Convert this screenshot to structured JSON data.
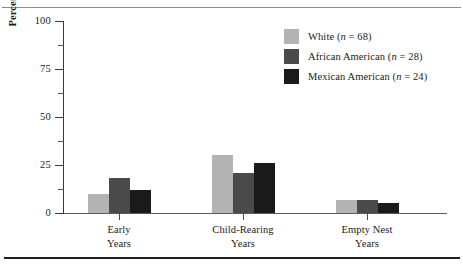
{
  "chart_data": {
    "type": "bar",
    "title": "",
    "xlabel": "",
    "ylabel": "Percentage Reporting Major Conflicts",
    "ylim": [
      0,
      100
    ],
    "yticks": [
      0,
      25,
      50,
      75,
      100
    ],
    "ytick_labels": [
      "0",
      "25",
      "50",
      "75",
      "100"
    ],
    "yminor_ticks": [
      12.5,
      37.5,
      62.5,
      87.5
    ],
    "grid": false,
    "legend_position": "top-right",
    "categories": [
      "Early Years",
      "Child-Rearing Years",
      "Empty Nest Years"
    ],
    "category_lines": [
      [
        "Early",
        "Years"
      ],
      [
        "Child-Rearing",
        "Years"
      ],
      [
        "Empty Nest",
        "Years"
      ]
    ],
    "series": [
      {
        "name": "White (n = 68)",
        "label_text": "White",
        "n": 68,
        "color": "#b3b3b3",
        "values": [
          10,
          30,
          7
        ]
      },
      {
        "name": "African American (n = 28)",
        "label_text": "African American",
        "n": 28,
        "color": "#4a4a4a",
        "values": [
          18,
          21,
          7
        ]
      },
      {
        "name": "Mexican American (n = 24)",
        "label_text": "Mexican American",
        "n": 24,
        "color": "#1a1a1a",
        "values": [
          12,
          26,
          5
        ]
      }
    ]
  },
  "legend": {
    "items": [
      {
        "label": "White (n = 68)",
        "name": "White",
        "n_prefix": "(",
        "n_symbol": "n",
        "n_eq": " = 68)",
        "color": "#b3b3b3"
      },
      {
        "label": "African American (n = 28)",
        "name": "African American",
        "n_prefix": "(",
        "n_symbol": "n",
        "n_eq": " = 28)",
        "color": "#4a4a4a"
      },
      {
        "label": "Mexican American (n = 24)",
        "name": "Mexican American",
        "n_prefix": "(",
        "n_symbol": "n",
        "n_eq": " = 24)",
        "color": "#1a1a1a"
      }
    ]
  },
  "axis": {
    "y_title": "Percentage Reporting Major Conflicts",
    "tick_labels": [
      "100",
      "75",
      "50",
      "25",
      "0"
    ]
  },
  "groups": [
    {
      "line1": "Early",
      "line2": "Years"
    },
    {
      "line1": "Child-Rearing",
      "line2": "Years"
    },
    {
      "line1": "Empty Nest",
      "line2": "Years"
    }
  ]
}
